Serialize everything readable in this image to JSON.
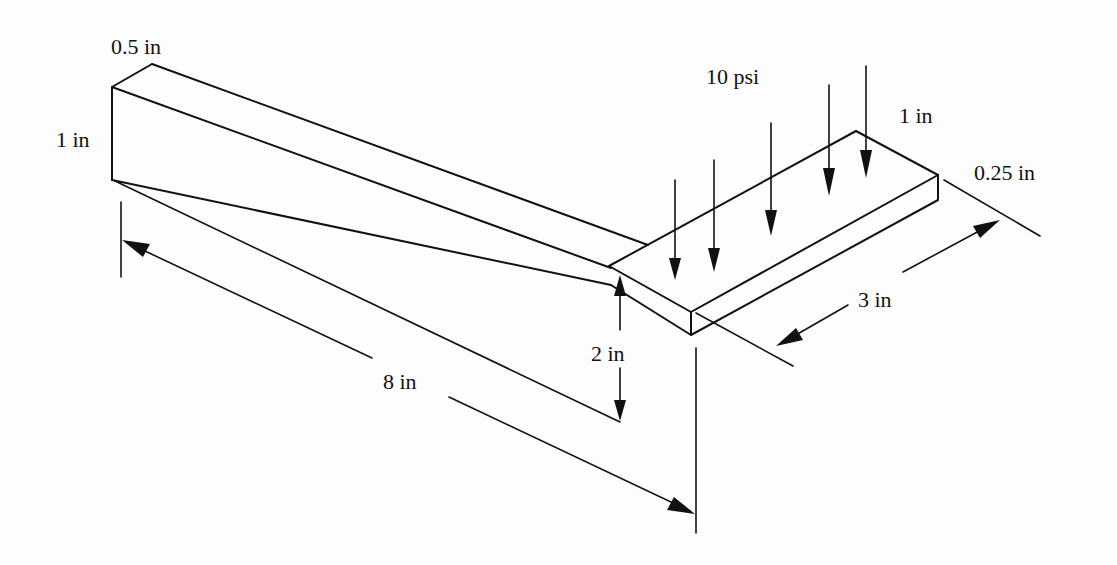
{
  "diagram": {
    "labels": {
      "beam_top_width": "0.5 in",
      "beam_left_height": "1 in",
      "pressure": "10 psi",
      "plate_width": "1 in",
      "plate_thickness": "0.25 in",
      "plate_length": "3 in",
      "beam_length": "8 in",
      "beam_end_height": "2 in"
    },
    "colors": {
      "line": "#111111",
      "background": "#fdfdfd"
    },
    "load_arrow_count": 6
  }
}
